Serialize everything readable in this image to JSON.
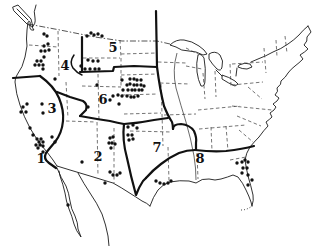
{
  "figure": {
    "type": "range-map",
    "background_color": "#ffffff",
    "ink_color": "#111111"
  },
  "map": {
    "dot_radius": 1.7,
    "region_labels": [
      {
        "label": "1",
        "x": 41,
        "y": 163
      },
      {
        "label": "2",
        "x": 98,
        "y": 161
      },
      {
        "label": "3",
        "x": 52,
        "y": 113
      },
      {
        "label": "4",
        "x": 65,
        "y": 70
      },
      {
        "label": "5",
        "x": 113,
        "y": 52
      },
      {
        "label": "6",
        "x": 103,
        "y": 104
      },
      {
        "label": "7",
        "x": 157,
        "y": 152
      },
      {
        "label": "8",
        "x": 200,
        "y": 163
      }
    ],
    "locality_clusters": [
      {
        "name": "pacific-northwest",
        "dots": [
          [
            44,
            34
          ],
          [
            47,
            36
          ],
          [
            44,
            46
          ],
          [
            48,
            44
          ],
          [
            41,
            51
          ],
          [
            45,
            51
          ],
          [
            49,
            50
          ],
          [
            44,
            57
          ],
          [
            37,
            61
          ],
          [
            41,
            61
          ],
          [
            35,
            65
          ],
          [
            39,
            65
          ],
          [
            43,
            65
          ],
          [
            43,
            69
          ],
          [
            55,
            79
          ]
        ]
      },
      {
        "name": "montana",
        "dots": [
          [
            87,
            36
          ],
          [
            91,
            33
          ],
          [
            94,
            35
          ],
          [
            98,
            34
          ],
          [
            102,
            36
          ]
        ]
      },
      {
        "name": "idaho-wyoming",
        "dots": [
          [
            88,
            60
          ],
          [
            93,
            61
          ],
          [
            98,
            61
          ],
          [
            81,
            66
          ],
          [
            85,
            69
          ],
          [
            90,
            69
          ],
          [
            95,
            69
          ],
          [
            99,
            69
          ],
          [
            97,
            85
          ]
        ]
      },
      {
        "name": "colorado-front-range",
        "dots": [
          [
            122,
            80
          ],
          [
            130,
            79
          ],
          [
            134,
            79
          ],
          [
            137,
            80
          ],
          [
            141,
            80
          ],
          [
            127,
            85
          ],
          [
            130,
            84
          ],
          [
            134,
            85
          ],
          [
            137,
            85
          ],
          [
            141,
            85
          ],
          [
            144,
            86
          ],
          [
            123,
            90
          ],
          [
            128,
            90
          ],
          [
            132,
            90
          ],
          [
            135,
            90
          ],
          [
            139,
            90
          ],
          [
            142,
            90
          ],
          [
            113,
            96
          ],
          [
            118,
            95
          ],
          [
            122,
            96
          ],
          [
            127,
            96
          ],
          [
            131,
            97
          ],
          [
            134,
            97
          ],
          [
            138,
            96
          ],
          [
            110,
            100
          ],
          [
            119,
            104
          ],
          [
            88,
            107
          ]
        ]
      },
      {
        "name": "california-north",
        "dots": [
          [
            23,
            107
          ],
          [
            27,
            104
          ],
          [
            21,
            112
          ],
          [
            26,
            112
          ],
          [
            42,
            104
          ],
          [
            43,
            113
          ]
        ]
      },
      {
        "name": "california-central",
        "dots": [
          [
            30,
            128
          ],
          [
            33,
            135
          ]
        ]
      },
      {
        "name": "california-south",
        "dots": [
          [
            37,
            139
          ],
          [
            41,
            139
          ],
          [
            39,
            142
          ],
          [
            43,
            142
          ],
          [
            36,
            145
          ],
          [
            40,
            145
          ],
          [
            43,
            146
          ],
          [
            38,
            148
          ],
          [
            43,
            152
          ],
          [
            52,
            137
          ],
          [
            55,
            142
          ]
        ]
      },
      {
        "name": "baja-california",
        "dots": [
          [
            68,
            205
          ]
        ]
      },
      {
        "name": "arizona-south",
        "dots": [
          [
            110,
            172
          ],
          [
            113,
            175
          ],
          [
            117,
            175
          ],
          [
            120,
            173
          ],
          [
            105,
            183
          ],
          [
            82,
            162
          ]
        ]
      },
      {
        "name": "new-mexico",
        "dots": [
          [
            110,
            138
          ],
          [
            113,
            137
          ],
          [
            109,
            143
          ],
          [
            112,
            143
          ],
          [
            115,
            144
          ],
          [
            111,
            148
          ]
        ]
      },
      {
        "name": "texas-panhandle",
        "dots": [
          [
            128,
            127
          ],
          [
            133,
            125
          ],
          [
            137,
            128
          ],
          [
            128,
            135
          ],
          [
            132,
            135
          ],
          [
            129,
            140
          ],
          [
            133,
            139
          ]
        ]
      },
      {
        "name": "texas-gulf-coast",
        "dots": [
          [
            156,
            181
          ],
          [
            160,
            183
          ],
          [
            164,
            184
          ],
          [
            168,
            183
          ],
          [
            171,
            181
          ]
        ]
      },
      {
        "name": "florida-georgia",
        "dots": [
          [
            237,
            163
          ],
          [
            242,
            162
          ],
          [
            245,
            160
          ],
          [
            248,
            162
          ],
          [
            243,
            168
          ],
          [
            247,
            168
          ],
          [
            242,
            173
          ],
          [
            248,
            175
          ],
          [
            252,
            180
          ],
          [
            248,
            185
          ]
        ]
      }
    ]
  }
}
